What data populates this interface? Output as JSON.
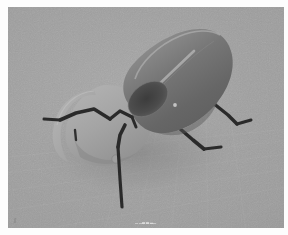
{
  "image": {
    "subject": "rhinoceros-beetle-3d-model",
    "medium": "grayscale 3d render",
    "width_px": 288,
    "height_px": 235,
    "border_color": "#fdfdfd"
  },
  "canvas": {
    "background_color": "#9b9b9b",
    "left_px": 8,
    "top_px": 7,
    "width_px": 276,
    "height_px": 221,
    "has_grid": true,
    "grid_opacity": 0.17
  },
  "palette": {
    "background_gray": "#9b9b9b",
    "elytra_dark": "#6d6d6d",
    "elytra_mid": "#7c7c7c",
    "elytra_light": "#8e8e8e",
    "elytra_highlight": "#c8c8c8",
    "elytra_cavity": "#4a4a4a",
    "pronotum_gray": "#a6a6a6",
    "pronotum_shadow": "#8d8d8d",
    "horn_gray": "#ababab",
    "leg_black": "#2b2b2b",
    "leg_black_soft": "#343434",
    "shadow_gray": "#8a8a8a"
  },
  "parts": [
    {
      "name": "elytra",
      "label": "Elytra (wing case)",
      "tone": "#6d6d6d"
    },
    {
      "name": "pronotum",
      "label": "Pronotum / head",
      "tone": "#a6a6a6"
    },
    {
      "name": "horn",
      "label": "Cephalic horn",
      "tone": "#ababab"
    },
    {
      "name": "leg-r1",
      "label": "Right foreleg",
      "tone": "#2b2b2b"
    },
    {
      "name": "leg-r2",
      "label": "Right midleg",
      "tone": "#2b2b2b"
    },
    {
      "name": "leg-front",
      "label": "Front descending leg",
      "tone": "#2b2b2b"
    },
    {
      "name": "leg-l1",
      "label": "Left foreleg",
      "tone": "#2b2b2b"
    },
    {
      "name": "leg-l2",
      "label": "Left midleg stub",
      "tone": "#2b2b2b"
    }
  ],
  "overlay": {
    "watermark_text": "▁▁▃▃▂▁",
    "corner_mark_text": "ʃʃ"
  }
}
